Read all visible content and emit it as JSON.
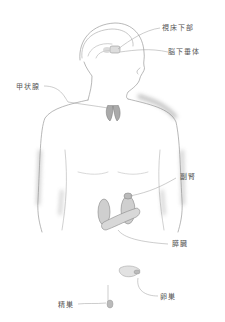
{
  "labels": {
    "hypothalamus": "視床下部",
    "pituitary": "脳下垂体",
    "thyroid": "甲状腺",
    "adrenal": "副腎",
    "pancreas": "膵臓",
    "testis": "精巣",
    "ovary": "卵巣"
  },
  "colors": {
    "background": "#ffffff",
    "pencil": "#8a8a8a",
    "label": "#555555"
  }
}
